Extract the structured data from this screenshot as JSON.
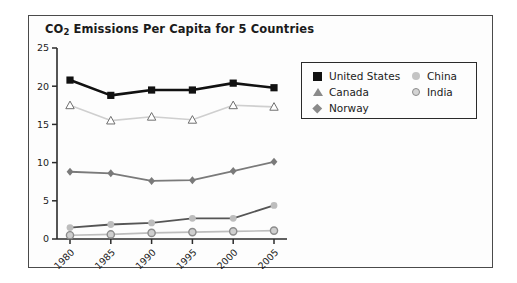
{
  "figure": {
    "title_main": "CO",
    "title_sub": "2",
    "title_rest": " Emissions Per Capita for 5 Countries"
  },
  "legend": {
    "left_items": [
      {
        "label": "United States",
        "marker": "filled-square-black",
        "color": "#111111"
      },
      {
        "label": "Canada",
        "marker": "open-triangle",
        "color": "#cfcfcf"
      },
      {
        "label": "Norway",
        "marker": "diamond-gray",
        "color": "#7a7a7a"
      }
    ],
    "right_items": [
      {
        "label": "China",
        "marker": "filled-circle-light",
        "color": "#c4c4c4"
      },
      {
        "label": "India",
        "marker": "ringed-circle-gray",
        "color": "#9a9a9a"
      }
    ]
  },
  "chart_data": {
    "type": "line",
    "title": "CO2 Emissions Per Capita for 5 Countries",
    "xlabel": "",
    "ylabel": "Metric Tons",
    "categories": [
      "1980",
      "1985",
      "1990",
      "1995",
      "2000",
      "2005"
    ],
    "x_tick_labels": [
      "1980",
      "1985",
      "1990",
      "1995",
      "2000",
      "2005"
    ],
    "y_tick_labels": [
      "0",
      "5",
      "10",
      "15",
      "20",
      "25"
    ],
    "ylim": [
      0,
      25
    ],
    "ytick_step": 5,
    "grid": false,
    "legend_position": "upper-right-inside",
    "xtick_rotation_degrees": -45,
    "series": [
      {
        "name": "United States",
        "marker": "filled-square-black",
        "color": "#111111",
        "line_width": 2.6,
        "values": [
          20.8,
          18.8,
          19.5,
          19.5,
          20.4,
          19.8
        ]
      },
      {
        "name": "Canada",
        "marker": "open-triangle",
        "color": "#cfcfcf",
        "line_width": 1.6,
        "values": [
          17.5,
          15.5,
          16.0,
          15.6,
          17.5,
          17.3
        ]
      },
      {
        "name": "Norway",
        "marker": "diamond-gray",
        "color": "#7a7a7a",
        "line_width": 1.8,
        "values": [
          8.8,
          8.6,
          7.6,
          7.7,
          8.9,
          10.1
        ]
      },
      {
        "name": "China",
        "marker": "filled-circle-light",
        "color": "#555555",
        "marker_color": "#bdbdbd",
        "line_width": 1.8,
        "values": [
          1.5,
          1.9,
          2.1,
          2.7,
          2.7,
          4.4
        ]
      },
      {
        "name": "India",
        "marker": "ringed-circle-gray",
        "color": "#bdbdbd",
        "marker_color": "#a8a8a8",
        "line_width": 1.6,
        "values": [
          0.5,
          0.6,
          0.8,
          0.9,
          1.0,
          1.1
        ]
      }
    ]
  }
}
